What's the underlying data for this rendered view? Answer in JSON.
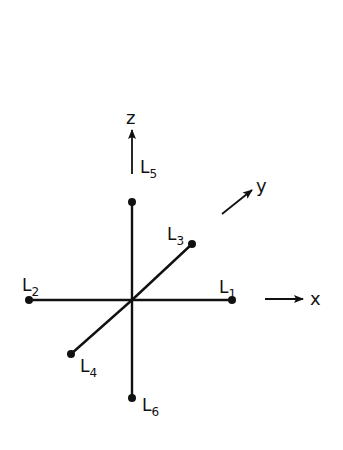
{
  "diagram": {
    "center": [
      132,
      300
    ],
    "ink_color": "#111111",
    "background": "#ffffff",
    "legs": [
      {
        "id": "L1",
        "label": "L",
        "sub": "1",
        "end": [
          232,
          300
        ],
        "label_pos": [
          219,
          289
        ]
      },
      {
        "id": "L2",
        "label": "L",
        "sub": "2",
        "end": [
          29,
          300
        ],
        "label_pos": [
          23,
          290
        ]
      },
      {
        "id": "L3",
        "label": "L",
        "sub": "3",
        "end": [
          192,
          244
        ],
        "label_pos": [
          168,
          237
        ]
      },
      {
        "id": "L4",
        "label": "L",
        "sub": "4",
        "end": [
          71,
          354
        ],
        "label_pos": [
          80,
          373
        ]
      },
      {
        "id": "L5",
        "label": "L",
        "sub": "5",
        "end": [
          132,
          202
        ],
        "label_pos": [
          140,
          171
        ]
      },
      {
        "id": "L6",
        "label": "L",
        "sub": "6",
        "end": [
          132,
          398
        ],
        "label_pos": [
          142,
          411
        ]
      }
    ],
    "axes": [
      {
        "name": "x",
        "label": "x",
        "from": [
          265,
          299
        ],
        "to": [
          303,
          299
        ],
        "label_pos": [
          311,
          305
        ]
      },
      {
        "name": "y",
        "label": "y",
        "from": [
          222,
          214
        ],
        "to": [
          252,
          190
        ],
        "label_pos": [
          257,
          192
        ]
      },
      {
        "name": "z",
        "label": "z",
        "from": [
          132,
          174
        ],
        "to": [
          132,
          130
        ],
        "label_pos": [
          127,
          124
        ]
      }
    ]
  },
  "labels": {
    "L": "L",
    "s1": "1",
    "s2": "2",
    "s3": "3",
    "s4": "4",
    "s5": "5",
    "s6": "6",
    "x": "x",
    "y": "y",
    "z": "z"
  }
}
